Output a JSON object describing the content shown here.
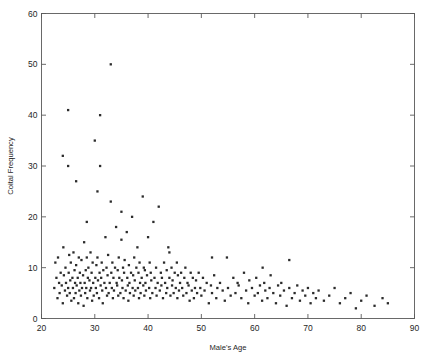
{
  "figure": {
    "background": "#ffffff",
    "frame_color": "#5a5a5a",
    "marker_color": "#2b2b2b",
    "caption_fragment": ""
  },
  "chart_data": {
    "type": "scatter",
    "title": "",
    "xlabel": "Male's Age",
    "ylabel": "Coital Frequency",
    "xlim": [
      20,
      90
    ],
    "ylim": [
      0,
      60
    ],
    "xticks": [
      20,
      30,
      40,
      50,
      60,
      70,
      80,
      90
    ],
    "yticks": [
      0,
      10,
      20,
      30,
      40,
      50,
      60
    ],
    "grid": false,
    "legend": null,
    "marker": "dot",
    "marker_size": 1.6,
    "n_points": 268,
    "x": [
      22.4,
      22.6,
      22.8,
      23.0,
      23.1,
      23.3,
      23.4,
      23.6,
      23.8,
      24.0,
      24.1,
      24.2,
      24.4,
      24.5,
      24.6,
      24.8,
      25.0,
      25.0,
      25.1,
      25.2,
      25.3,
      25.4,
      25.5,
      25.6,
      25.8,
      25.9,
      26.0,
      26.1,
      26.2,
      26.3,
      26.4,
      26.5,
      26.6,
      26.8,
      26.9,
      27.0,
      27.1,
      27.2,
      27.3,
      27.4,
      27.5,
      27.6,
      27.8,
      27.9,
      28.0,
      28.1,
      28.2,
      28.3,
      28.4,
      28.5,
      28.6,
      28.7,
      28.8,
      29.0,
      29.1,
      29.2,
      29.3,
      29.4,
      29.5,
      29.6,
      29.7,
      29.8,
      30.0,
      30.1,
      30.2,
      30.3,
      30.4,
      30.5,
      30.6,
      30.8,
      30.9,
      31.0,
      31.1,
      31.2,
      31.3,
      31.4,
      31.5,
      31.6,
      31.8,
      32.0,
      32.1,
      32.2,
      32.3,
      32.4,
      32.5,
      32.6,
      32.8,
      33.0,
      33.1,
      33.2,
      33.3,
      33.4,
      33.5,
      33.6,
      33.8,
      34.0,
      34.1,
      34.2,
      34.3,
      34.4,
      34.5,
      34.6,
      34.8,
      35.0,
      35.1,
      35.2,
      35.3,
      35.4,
      35.5,
      35.6,
      35.8,
      36.0,
      36.1,
      36.2,
      36.3,
      36.4,
      36.5,
      36.6,
      36.8,
      37.0,
      37.1,
      37.2,
      37.3,
      37.4,
      37.5,
      37.6,
      37.8,
      38.0,
      38.1,
      38.2,
      38.3,
      38.4,
      38.5,
      38.6,
      38.8,
      39.0,
      39.1,
      39.2,
      39.3,
      39.4,
      39.5,
      39.6,
      39.8,
      40.0,
      40.2,
      40.3,
      40.4,
      40.5,
      40.6,
      40.8,
      41.0,
      41.2,
      41.4,
      41.5,
      41.6,
      41.8,
      42.0,
      42.2,
      42.4,
      42.5,
      42.6,
      42.8,
      43.0,
      43.2,
      43.4,
      43.5,
      43.6,
      43.8,
      44.0,
      44.2,
      44.4,
      44.5,
      44.6,
      44.8,
      45.0,
      45.2,
      45.4,
      45.5,
      45.6,
      45.8,
      46.0,
      46.2,
      46.4,
      46.6,
      46.8,
      47.0,
      47.2,
      47.4,
      47.6,
      47.8,
      48.0,
      48.2,
      48.4,
      48.6,
      48.8,
      49.0,
      49.2,
      49.5,
      49.8,
      50.0,
      50.3,
      50.6,
      51.0,
      51.4,
      51.8,
      52.0,
      52.4,
      52.8,
      53.0,
      53.5,
      54.0,
      54.4,
      54.8,
      55.0,
      55.5,
      56.0,
      56.4,
      56.8,
      57.0,
      57.5,
      58.0,
      58.4,
      58.8,
      59.0,
      59.5,
      60.0,
      60.3,
      60.6,
      61.0,
      61.4,
      61.8,
      62.0,
      62.4,
      62.8,
      63.0,
      63.5,
      64.0,
      64.4,
      64.8,
      65.0,
      65.5,
      66.0,
      66.5,
      67.0,
      67.5,
      68.0,
      68.5,
      69.0,
      69.5,
      70.0,
      70.5,
      71.0,
      71.5,
      72.0,
      73.0,
      74.0,
      75.0,
      76.0,
      77.0,
      78.0,
      79.0,
      80.0,
      81.0,
      82.5,
      84.0,
      85.0,
      25.0,
      31.0,
      30.5,
      33.0,
      24.0,
      26.5,
      28.5,
      35.0,
      44.0,
      52.0,
      61.5,
      66.5
    ],
    "y": [
      6.0,
      11.0,
      8.0,
      4.0,
      12.0,
      7.0,
      5.0,
      9.0,
      6.5,
      3.0,
      14.0,
      8.5,
      5.5,
      10.0,
      7.0,
      4.5,
      41.0,
      6.0,
      9.0,
      12.5,
      5.0,
      7.5,
      11.0,
      3.5,
      8.0,
      6.0,
      13.0,
      4.0,
      9.5,
      7.0,
      5.0,
      10.5,
      6.5,
      8.0,
      3.0,
      12.0,
      5.5,
      9.0,
      7.0,
      4.5,
      11.5,
      6.0,
      8.5,
      2.5,
      15.0,
      7.0,
      5.0,
      9.5,
      6.0,
      12.0,
      4.0,
      8.0,
      10.0,
      7.5,
      5.5,
      13.0,
      6.0,
      9.0,
      3.5,
      11.0,
      7.0,
      4.5,
      35.0,
      8.0,
      6.0,
      10.5,
      5.0,
      12.0,
      7.5,
      4.0,
      9.0,
      40.0,
      6.5,
      8.0,
      11.0,
      5.5,
      3.0,
      9.5,
      7.0,
      16.0,
      6.0,
      10.0,
      4.5,
      8.5,
      12.5,
      5.0,
      7.0,
      50.0,
      9.0,
      6.0,
      11.0,
      4.0,
      8.0,
      5.5,
      10.0,
      18.0,
      7.0,
      6.5,
      9.5,
      4.5,
      12.0,
      8.0,
      5.0,
      21.0,
      7.5,
      6.0,
      10.0,
      4.0,
      9.0,
      11.5,
      5.5,
      17.0,
      8.0,
      6.5,
      3.5,
      10.5,
      7.0,
      5.0,
      9.0,
      20.0,
      6.0,
      8.5,
      4.5,
      12.0,
      7.5,
      5.5,
      10.0,
      14.0,
      6.0,
      9.0,
      4.0,
      11.0,
      7.0,
      5.0,
      8.0,
      24.0,
      6.5,
      10.0,
      4.5,
      9.5,
      7.0,
      5.5,
      8.5,
      16.0,
      6.0,
      11.0,
      4.0,
      9.0,
      7.5,
      5.0,
      19.0,
      8.0,
      6.0,
      10.0,
      4.5,
      7.0,
      22.0,
      5.5,
      9.0,
      6.5,
      8.0,
      4.0,
      11.0,
      7.0,
      5.0,
      9.5,
      6.0,
      14.0,
      8.0,
      4.5,
      10.0,
      6.5,
      7.5,
      5.0,
      9.0,
      6.0,
      11.0,
      4.0,
      8.5,
      5.5,
      7.0,
      9.0,
      6.0,
      4.5,
      8.0,
      10.0,
      5.0,
      7.0,
      6.5,
      3.5,
      9.0,
      5.5,
      8.0,
      4.0,
      6.0,
      7.5,
      5.0,
      9.0,
      6.0,
      4.5,
      8.0,
      5.5,
      7.0,
      3.0,
      6.5,
      5.0,
      8.5,
      4.0,
      6.0,
      7.0,
      5.5,
      3.5,
      12.0,
      6.0,
      4.5,
      8.0,
      5.0,
      7.0,
      6.5,
      4.0,
      9.0,
      5.5,
      3.0,
      7.5,
      6.0,
      4.5,
      8.0,
      5.0,
      6.5,
      3.5,
      7.0,
      5.5,
      4.0,
      6.0,
      8.5,
      5.0,
      3.0,
      6.5,
      4.5,
      7.0,
      5.5,
      2.5,
      6.0,
      4.0,
      5.0,
      6.5,
      3.5,
      5.5,
      4.5,
      6.0,
      3.0,
      5.0,
      4.0,
      5.5,
      3.5,
      4.5,
      6.0,
      3.0,
      4.0,
      5.0,
      2.0,
      3.5,
      4.5,
      2.5,
      4.0,
      3.0,
      30.0,
      30.0,
      25.0,
      23.0,
      32.0,
      27.0,
      19.0,
      15.5,
      13.0,
      12.0,
      10.0,
      11.5
    ]
  }
}
